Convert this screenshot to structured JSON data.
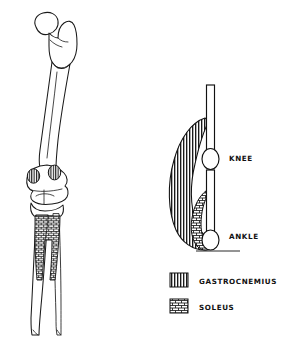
{
  "figure": {
    "background_color": "#ffffff",
    "ink_color": "#111111",
    "panels": {
      "left_panel_name": "anatomical-femur-tibia-drawing",
      "right_panel_name": "schematic-lever-diagram"
    }
  },
  "schematic": {
    "joint_labels": [
      {
        "id": "knee",
        "text": "KNEE"
      },
      {
        "id": "ankle",
        "text": "ANKLE"
      }
    ],
    "knee_label": "KNEE",
    "ankle_label": "ANKLE",
    "segments": [
      {
        "id": "femur",
        "name": "femur-segment"
      },
      {
        "id": "tibia",
        "name": "tibia-segment"
      }
    ],
    "muscles": [
      {
        "id": "gastrocnemius",
        "pattern": "vertical-stripes",
        "spans": "knee-to-ankle"
      },
      {
        "id": "soleus",
        "pattern": "brick-crosshatch",
        "spans": "tibia-to-ankle"
      }
    ]
  },
  "legend": {
    "items": [
      {
        "id": "gastrocnemius",
        "label": "GASTROCNEMIUS",
        "pattern": "vertical-stripes"
      },
      {
        "id": "soleus",
        "label": "SOLEUS",
        "pattern": "brick-crosshatch"
      }
    ],
    "gastrocnemius_label": "GASTROCNEMIUS",
    "soleus_label": "SOLEUS"
  },
  "anatomy": {
    "bone_name": "femur-tibia-fibula",
    "origin_sites": [
      {
        "id": "gastrocnemius-medial-head",
        "pattern": "vertical-stripes"
      },
      {
        "id": "gastrocnemius-lateral-head",
        "pattern": "vertical-stripes"
      },
      {
        "id": "soleus-origin",
        "pattern": "brick-crosshatch"
      }
    ]
  }
}
